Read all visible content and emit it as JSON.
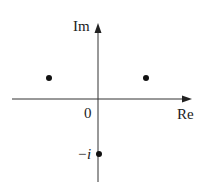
{
  "diagram": {
    "type": "complex-plane",
    "axes": {
      "x_label": "Re",
      "y_label": "Im",
      "origin_label": "0"
    },
    "points": [
      {
        "name": "point-upper-left",
        "x": 49,
        "y": 78
      },
      {
        "name": "point-upper-right",
        "x": 146,
        "y": 78
      },
      {
        "name": "point-minus-i",
        "x": 99,
        "y": 154,
        "label": "−i"
      }
    ],
    "colors": {
      "ink": "#222222",
      "background": "#ffffff"
    }
  }
}
